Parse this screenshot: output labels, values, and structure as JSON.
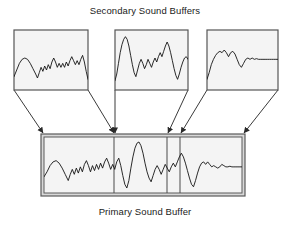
{
  "figure": {
    "type": "diagram",
    "title_top": "Secondary Sound Buffers",
    "title_bottom": "Primary Sound Buffer",
    "colors": {
      "stroke": "#404040",
      "wave": "#1a1a1a",
      "fill": "#f4f4f4",
      "primary_frame": "#8a8a8a",
      "background": "#ffffff"
    }
  },
  "secondary_buffers": [
    {
      "name": "secondary-buffer-1",
      "label": "Secondary Buffer 1",
      "box": {
        "x": 14,
        "y": 30,
        "w": 74,
        "h": 60
      },
      "waveform": "6,70 9,60 12,50 15,44 18,42 21,44 24,50 27,58 30,66 32,72 34,64 36,56 38,62 40,54 42,60 44,52 46,58 48,48 50,42 52,48 54,56 56,50 58,56 60,50 62,56 64,48 66,54 68,46 70,40 72,46 74,52 76,46 78,52 80,44 82,38 84,48 86,62 88,74"
    },
    {
      "name": "secondary-buffer-2",
      "label": "Secondary Buffer 2",
      "box": {
        "x": 115,
        "y": 30,
        "w": 73,
        "h": 60
      },
      "waveform": "4,76 6,66 8,50 10,34 12,22 14,14 16,10 18,14 20,24 22,38 24,52 26,64 28,70 30,60 32,50 34,44 36,50 38,58 40,52 42,44 44,50 46,56 48,48 50,42 52,48 54,40 56,34 58,40 60,32 62,24 64,18 66,24 68,34 70,46 72,58 74,68 76,74 78,66 80,56 82,48 84,42 86,40 88,44"
    },
    {
      "name": "secondary-buffer-3",
      "label": "Secondary Buffer 3",
      "box": {
        "x": 207,
        "y": 30,
        "w": 71,
        "h": 60
      },
      "waveform": "4,74 6,64 8,52 10,44 12,38 14,34 16,32 18,34 20,30 22,34 24,40 26,34 28,32 30,36 32,44 34,52 36,56 38,50 40,44 42,42 44,44 46,42 48,44 50,43 52,44 54,44 56,44 58,44 60,44 62,44 64,44 66,44 68,44 70,44"
    }
  ],
  "primary_buffer": {
    "name": "primary-buffer",
    "label": "Primary Sound Buffer",
    "outer_box": {
      "x": 41,
      "y": 134,
      "w": 204,
      "h": 62
    },
    "segment_dividers": [
      114,
      167,
      180
    ],
    "waveform": "6,64 9,56 12,46 15,40 18,38 21,42 24,50 27,60 30,70 32,60 34,52 36,60 38,50 40,58 42,48 44,56 46,44 48,38 50,46 52,56 54,46 56,54 58,44 60,52 62,42 64,50 66,40 68,34 70,42 72,52 74,44 76,52 78,40 80,34 82,46 84,62 86,76 88,82 90,70 92,50 94,32 96,18 98,10 100,8 102,14 104,26 106,42 108,56 110,66 112,72 114,62 116,52 118,46 120,52 122,60 124,52 126,44 128,50 130,56 132,48 134,42 136,48 138,40 140,32 142,26 144,32 146,42 148,54 150,66 152,76 154,80 156,70 158,58 160,48 162,42 164,40 166,44 168,40 170,44 172,48 174,46 176,48 178,50 180,48 182,44 184,46 186,48 188,48 190,47 192,48 194,48 196,48 198,48 200,48 202,48"
  },
  "connectors": [
    {
      "name": "connector-1-left",
      "from": [
        14,
        90
      ],
      "to": [
        43,
        133
      ]
    },
    {
      "name": "connector-1-right",
      "from": [
        88,
        90
      ],
      "to": [
        114,
        133
      ]
    },
    {
      "name": "connector-2-left",
      "from": [
        115,
        90
      ],
      "to": [
        115,
        133
      ]
    },
    {
      "name": "connector-2-right",
      "from": [
        188,
        90
      ],
      "to": [
        168,
        133
      ]
    },
    {
      "name": "connector-3-left",
      "from": [
        207,
        90
      ],
      "to": [
        181,
        133
      ]
    },
    {
      "name": "connector-3-right",
      "from": [
        278,
        90
      ],
      "to": [
        244,
        133
      ]
    }
  ],
  "arrow_targets": [
    42,
    114,
    167,
    180,
    243
  ]
}
